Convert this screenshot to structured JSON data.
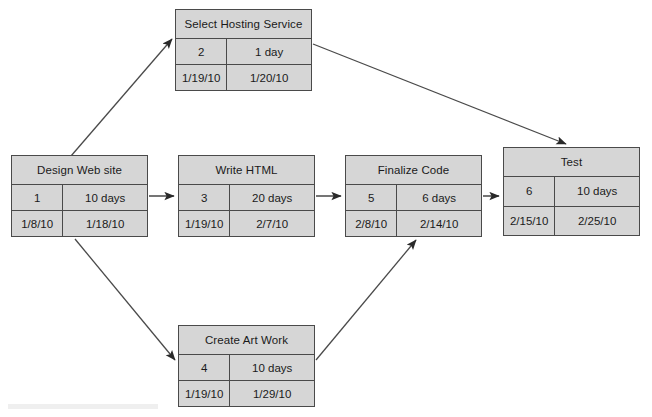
{
  "diagram": {
    "type": "project-network-diagram",
    "line_color": "#4a4a4a",
    "node_fill": "#d6d6d6",
    "background": "#ffffff",
    "nodes": [
      {
        "id": "select-hosting-service",
        "title": "Select Hosting Service",
        "task_number": "2",
        "duration": "1 day",
        "start_date": "1/19/10",
        "end_date": "1/20/10",
        "x": 175,
        "y": 9,
        "width": 137,
        "height": 82
      },
      {
        "id": "design-web-site",
        "title": "Design Web site",
        "task_number": "1",
        "duration": "10 days",
        "start_date": "1/8/10",
        "end_date": "1/18/10",
        "x": 11,
        "y": 155,
        "width": 137,
        "height": 82
      },
      {
        "id": "write-html",
        "title": "Write HTML",
        "task_number": "3",
        "duration": "20 days",
        "start_date": "1/19/10",
        "end_date": "2/7/10",
        "x": 178,
        "y": 155,
        "width": 137,
        "height": 82
      },
      {
        "id": "finalize-code",
        "title": "Finalize Code",
        "task_number": "5",
        "duration": "6 days",
        "start_date": "2/8/10",
        "end_date": "2/14/10",
        "x": 345,
        "y": 155,
        "width": 137,
        "height": 82
      },
      {
        "id": "test",
        "title": "Test",
        "task_number": "6",
        "duration": "10 days",
        "start_date": "2/15/10",
        "end_date": "2/25/10",
        "x": 503,
        "y": 147,
        "width": 137,
        "height": 89
      },
      {
        "id": "create-art-work",
        "title": "Create Art Work",
        "task_number": "4",
        "duration": "10 days",
        "start_date": "1/19/10",
        "end_date": "1/29/10",
        "x": 178,
        "y": 325,
        "width": 137,
        "height": 82
      }
    ],
    "connectors": [
      {
        "id": "design-to-select-hosting",
        "from": "design-web-site",
        "to": "select-hosting-service"
      },
      {
        "id": "design-to-write-html",
        "from": "design-web-site",
        "to": "write-html"
      },
      {
        "id": "design-to-create-art-work",
        "from": "design-web-site",
        "to": "create-art-work"
      },
      {
        "id": "select-hosting-to-test",
        "from": "select-hosting-service",
        "to": "test"
      },
      {
        "id": "write-html-to-finalize-code",
        "from": "write-html",
        "to": "finalize-code"
      },
      {
        "id": "finalize-code-to-test",
        "from": "finalize-code",
        "to": "test"
      },
      {
        "id": "create-art-work-to-finalize-code",
        "from": "create-art-work",
        "to": "finalize-code"
      }
    ]
  }
}
